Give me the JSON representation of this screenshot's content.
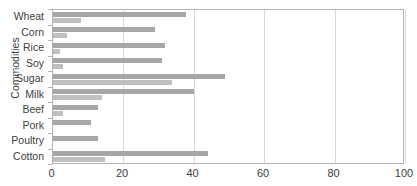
{
  "chart_data": {
    "type": "bar",
    "orientation": "horizontal",
    "title": "",
    "xlabel": "",
    "ylabel": "Commodities",
    "xlim": [
      0,
      100
    ],
    "xticks": [
      0,
      20,
      40,
      60,
      80,
      100
    ],
    "xtick_labels": [
      "0",
      "20",
      "40",
      "60",
      "80",
      "100"
    ],
    "grid": "vertical",
    "legend": "none",
    "categories": [
      "Wheat",
      "Corn",
      "Rice",
      "Soy",
      "Sugar",
      "Milk",
      "Beef",
      "Pork",
      "Poultry",
      "Cotton"
    ],
    "series": [
      {
        "name": "Series 1",
        "color": "#a6a6a6",
        "values": [
          38,
          29,
          32,
          31,
          49,
          40,
          13,
          11,
          13,
          44
        ]
      },
      {
        "name": "Series 2",
        "color": "#bfbfbf",
        "values": [
          8,
          4,
          2,
          3,
          34,
          14,
          3,
          0,
          0,
          15
        ]
      }
    ]
  },
  "colors": {
    "series_1": "#a6a6a6",
    "series_2": "#bfbfbf",
    "gridline": "#d9d9d9",
    "axis_line": "#b4b4b4",
    "text": "#404040"
  }
}
